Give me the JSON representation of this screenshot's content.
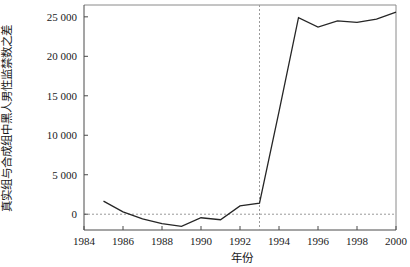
{
  "chart_data": {
    "type": "line",
    "title": "",
    "xlabel": "年份",
    "ylabel": "真实组与合成组中黑人男性监禁数之差",
    "xlim": [
      1984,
      2000
    ],
    "ylim": [
      -2000,
      26500
    ],
    "xticks": [
      1984,
      1986,
      1988,
      1990,
      1992,
      1994,
      1996,
      1998,
      2000
    ],
    "xtick_labels": [
      "1984",
      "1986",
      "1988",
      "1990",
      "1992",
      "1994",
      "1996",
      "1998",
      "2000"
    ],
    "yticks": [
      0,
      5000,
      10000,
      15000,
      20000,
      25000
    ],
    "ytick_labels": [
      "0",
      "5 000",
      "10 000",
      "15 000",
      "20 000",
      "25 000"
    ],
    "grid": false,
    "legend": null,
    "x": [
      1985,
      1986,
      1987,
      1988,
      1989,
      1990,
      1991,
      1992,
      1993,
      1994,
      1995,
      1996,
      1997,
      1998,
      1999,
      2000
    ],
    "values": [
      1650,
      300,
      -600,
      -1200,
      -1550,
      -450,
      -700,
      1050,
      1400,
      13000,
      24900,
      23700,
      24500,
      24300,
      24700,
      25600
    ],
    "series": [
      {
        "name": "真实组与合成组之差",
        "values": [
          1650,
          300,
          -600,
          -1200,
          -1550,
          -450,
          -700,
          1050,
          1400,
          13000,
          24900,
          23700,
          24500,
          24300,
          24700,
          25600
        ],
        "color": "#262626"
      }
    ],
    "annotations": [
      {
        "type": "hline",
        "y": 0,
        "style": "dashed",
        "color": "#9a9a9a"
      },
      {
        "type": "vline",
        "x": 1993,
        "style": "dashed",
        "color": "#9a9a9a"
      }
    ]
  }
}
